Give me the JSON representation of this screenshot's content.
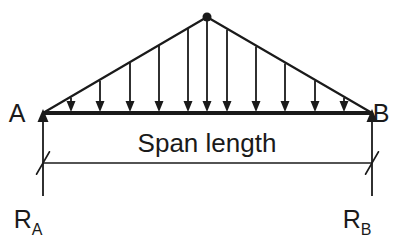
{
  "diagram": {
    "type": "structural-beam-load-diagram",
    "canvas": {
      "width": 407,
      "height": 240,
      "background": "#ffffff"
    },
    "stroke_color": "#1a1a1a",
    "text_color": "#1a1a1a",
    "labels": {
      "left_support": "A",
      "right_support": "B",
      "span": "Span length",
      "left_reaction_base": "R",
      "left_reaction_sub": "A",
      "right_reaction_base": "R",
      "right_reaction_sub": "B"
    },
    "geometry": {
      "beam": {
        "x1": 43,
        "y1": 113,
        "x2": 372,
        "y2": 113,
        "stroke_width": 4
      },
      "apex": {
        "x": 207,
        "y": 17,
        "radius": 4.5
      },
      "load_slope_left": {
        "x1": 43,
        "y1": 113,
        "x2": 207,
        "y2": 17
      },
      "load_slope_right": {
        "x1": 207,
        "y1": 17,
        "x2": 372,
        "y2": 113
      },
      "dimension_line": {
        "x1": 43,
        "y1": 163,
        "x2": 372,
        "y2": 163,
        "stroke_width": 1.3
      },
      "dimension_tick_length": 26,
      "dimension_tick_angle_deg": 60,
      "support_line_bottom_y": 196,
      "support_arrow_tip_y": 109,
      "arrow_head_width": 11,
      "arrow_head_length": 13
    },
    "load_arrows": {
      "count": 11,
      "x_positions": [
        71,
        100,
        130,
        159,
        188,
        207,
        227,
        256,
        285,
        315,
        344
      ],
      "beam_y": 113,
      "head_width": 9,
      "head_length": 11,
      "stroke_width": 1.8
    },
    "label_positions": {
      "left_support": {
        "x": 17,
        "y": 122
      },
      "right_support": {
        "x": 381,
        "y": 122
      },
      "span": {
        "x": 207,
        "y": 152
      },
      "left_reaction": {
        "x": 28,
        "y": 228
      },
      "right_reaction": {
        "x": 357,
        "y": 228
      }
    }
  }
}
